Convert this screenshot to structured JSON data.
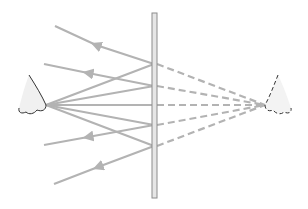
{
  "diagram": {
    "colors": {
      "ray": "#b3b3b3",
      "mirror_fill": "#e6e6e6",
      "mirror_stroke": "#8c8c8c",
      "eye_fill": "#f0f0f0",
      "eye_stroke": "#333333",
      "background": "#ffffff"
    },
    "mirror": {
      "x": 154,
      "y_top": 13,
      "y_bottom": 198,
      "width": 5
    },
    "real_eye": {
      "tip": [
        46,
        105
      ]
    },
    "virtual_eye": {
      "tip": [
        265,
        105
      ]
    },
    "incidence_points_y": [
      64,
      86,
      105,
      125,
      146
    ],
    "reflected_ray_ends": [
      [
        55,
        26
      ],
      [
        44,
        64
      ],
      [
        46,
        105
      ],
      [
        44,
        145
      ],
      [
        54,
        184
      ]
    ]
  }
}
